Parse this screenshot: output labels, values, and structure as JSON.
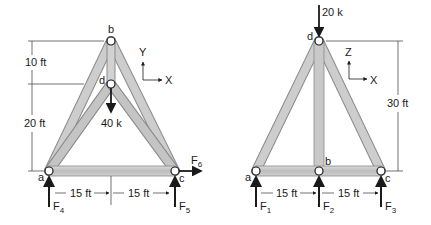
{
  "left_figure": {
    "nodes": {
      "a": {
        "label": "a",
        "x": 49,
        "y": 171
      },
      "b": {
        "label": "b",
        "x": 111,
        "y": 41
      },
      "c": {
        "label": "c",
        "x": 175,
        "y": 171
      },
      "d": {
        "label": "d",
        "x": 111,
        "y": 84
      }
    },
    "axes": {
      "vertical": "Y",
      "horizontal": "X"
    },
    "load": "40 k",
    "dimensions": {
      "top_height": "10 ft",
      "bottom_height": "20 ft",
      "left_span": "15 ft",
      "right_span": "15 ft"
    },
    "forces": {
      "left_reaction": "F",
      "left_reaction_sub": "4",
      "right_reaction": "F",
      "right_reaction_sub": "5",
      "horizontal": "F",
      "horizontal_sub": "6"
    }
  },
  "right_figure": {
    "nodes": {
      "a": {
        "label": "a",
        "x": 256,
        "y": 171
      },
      "b": {
        "label": "b",
        "x": 319,
        "y": 171
      },
      "c": {
        "label": "c",
        "x": 381,
        "y": 171
      },
      "d": {
        "label": "d",
        "x": 319,
        "y": 41
      }
    },
    "axes": {
      "vertical": "Z",
      "horizontal": "X"
    },
    "load": "20 k",
    "dimensions": {
      "height": "30 ft",
      "left_span": "15 ft",
      "right_span": "15 ft"
    },
    "forces": {
      "r1": "F",
      "r1_sub": "1",
      "r2": "F",
      "r2_sub": "2",
      "r3": "F",
      "r3_sub": "3"
    }
  },
  "colors": {
    "member_fill": "#c8c8c8",
    "member_edge": "#8a8a8a",
    "ink": "#1a1a1a"
  }
}
